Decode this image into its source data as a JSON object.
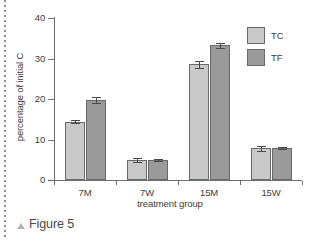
{
  "figure": {
    "caption_marker": "▲",
    "caption": "Figure 5"
  },
  "legend": {
    "position": "top-right",
    "entries": [
      {
        "label": "TC",
        "color": "#c9c9c9"
      },
      {
        "label": "TF",
        "color": "#9a9a9a"
      }
    ]
  },
  "chart_data": {
    "type": "bar",
    "title": "",
    "subtitle": "",
    "xlabel": "treatment group",
    "ylabel": "percentage of initial C",
    "categories": [
      "7M",
      "7W",
      "15M",
      "15W"
    ],
    "ylim": [
      0,
      40
    ],
    "yticks": [
      0,
      10,
      20,
      30,
      40
    ],
    "ytick_labels": [
      "0",
      "10",
      "20",
      "30",
      "40"
    ],
    "grid": false,
    "legend_position": "top-right",
    "series": [
      {
        "name": "TC",
        "color": "#c9c9c9",
        "values": [
          14.4,
          4.9,
          28.6,
          7.8
        ],
        "errors": [
          0.4,
          0.5,
          0.9,
          0.6
        ]
      },
      {
        "name": "TF",
        "color": "#9a9a9a",
        "values": [
          19.8,
          4.9,
          33.3,
          7.9
        ],
        "errors": [
          0.7,
          0.3,
          0.6,
          0.3
        ]
      }
    ]
  }
}
